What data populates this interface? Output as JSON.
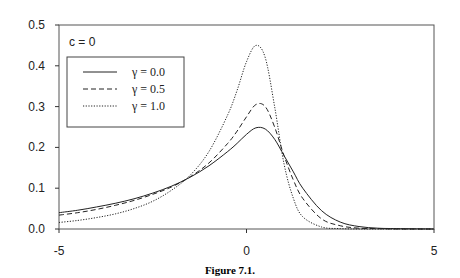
{
  "chart_data": {
    "type": "line",
    "title": "",
    "caption": "Figure 7.1.",
    "annotation": "c = 0",
    "xlabel": "",
    "ylabel": "",
    "xlim": [
      -5,
      5
    ],
    "ylim": [
      0,
      0.5
    ],
    "x_ticks": [
      "-5",
      "0",
      "5"
    ],
    "y_ticks": [
      "0.0",
      "0.1",
      "0.2",
      "0.3",
      "0.4",
      "0.5"
    ],
    "grid": false,
    "legend_position": "upper-left",
    "x": [
      -5,
      -4.5,
      -4,
      -3.5,
      -3,
      -2.5,
      -2,
      -1.5,
      -1,
      -0.5,
      -0.25,
      0,
      0.25,
      0.5,
      0.75,
      1,
      1.25,
      1.5,
      2,
      2.5,
      3,
      3.5,
      4,
      5
    ],
    "series": [
      {
        "name": "γ = 0.0",
        "style": "solid",
        "values": [
          0.04,
          0.046,
          0.054,
          0.063,
          0.074,
          0.088,
          0.105,
          0.127,
          0.155,
          0.19,
          0.21,
          0.232,
          0.248,
          0.245,
          0.22,
          0.18,
          0.14,
          0.1,
          0.045,
          0.017,
          0.006,
          0.002,
          0.001,
          0.0
        ]
      },
      {
        "name": "γ = 0.5",
        "style": "dashed",
        "values": [
          0.034,
          0.04,
          0.048,
          0.058,
          0.07,
          0.085,
          0.103,
          0.128,
          0.162,
          0.21,
          0.24,
          0.275,
          0.305,
          0.3,
          0.25,
          0.18,
          0.12,
          0.075,
          0.025,
          0.008,
          0.002,
          0.001,
          0.0,
          0.0
        ]
      },
      {
        "name": "γ = 1.0",
        "style": "dotted",
        "values": [
          0.016,
          0.021,
          0.028,
          0.037,
          0.05,
          0.068,
          0.095,
          0.132,
          0.19,
          0.28,
          0.34,
          0.41,
          0.45,
          0.42,
          0.3,
          0.16,
          0.075,
          0.03,
          0.005,
          0.001,
          0.0,
          0.0,
          0.0,
          0.0
        ]
      }
    ]
  }
}
